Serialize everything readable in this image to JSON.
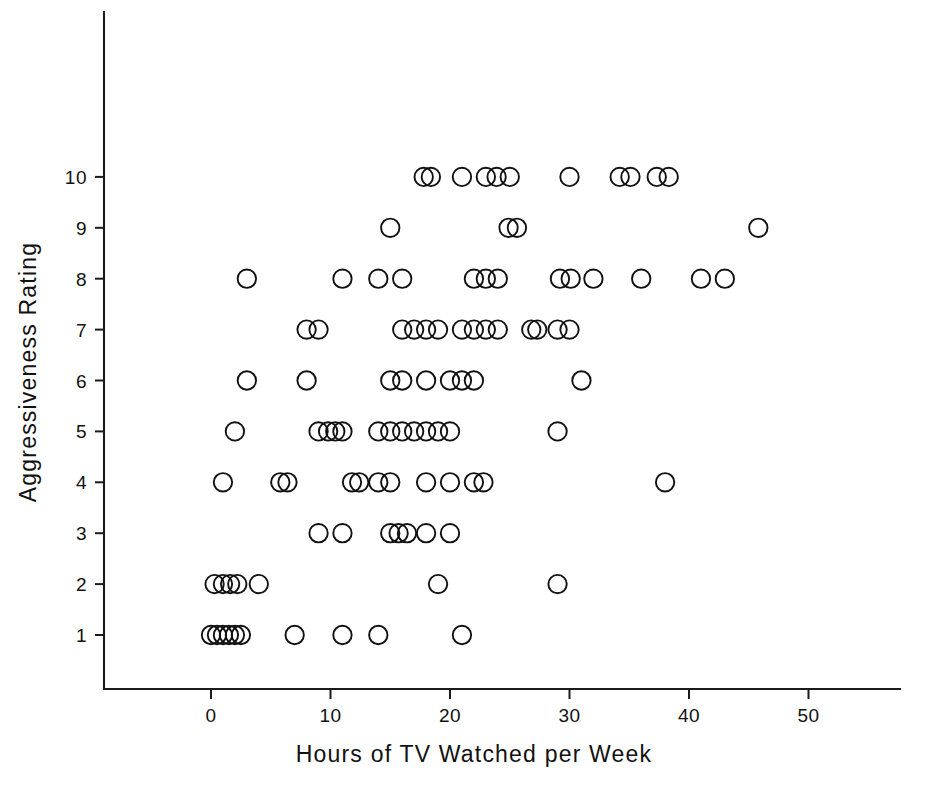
{
  "chart_data": {
    "type": "scatter",
    "title": "",
    "xlabel": "Hours of TV Watched per Week",
    "ylabel": "Aggressiveness Rating",
    "xlim": [
      -5,
      57
    ],
    "ylim": [
      0.3,
      11.4
    ],
    "xticks": [
      0,
      10,
      20,
      30,
      40,
      50
    ],
    "xticklabels": [
      "0",
      "10",
      "20",
      "30",
      "40",
      "50"
    ],
    "yticks": [
      1,
      2,
      3,
      4,
      5,
      6,
      7,
      8,
      9,
      10
    ],
    "yticklabels": [
      "1",
      "2",
      "3",
      "4",
      "5",
      "6",
      "7",
      "8",
      "9",
      "10"
    ],
    "grid": false,
    "legend": null,
    "marker": "open-circle",
    "marker_color": "#111111",
    "points": [
      {
        "x": 0,
        "y": 1
      },
      {
        "x": 0.5,
        "y": 1
      },
      {
        "x": 1,
        "y": 1
      },
      {
        "x": 1.5,
        "y": 1
      },
      {
        "x": 2,
        "y": 1
      },
      {
        "x": 2.5,
        "y": 1
      },
      {
        "x": 7,
        "y": 1
      },
      {
        "x": 11,
        "y": 1
      },
      {
        "x": 14,
        "y": 1
      },
      {
        "x": 21,
        "y": 1
      },
      {
        "x": 0.3,
        "y": 2
      },
      {
        "x": 1,
        "y": 2
      },
      {
        "x": 1.6,
        "y": 2
      },
      {
        "x": 2.2,
        "y": 2
      },
      {
        "x": 4,
        "y": 2
      },
      {
        "x": 19,
        "y": 2
      },
      {
        "x": 29,
        "y": 2
      },
      {
        "x": 9,
        "y": 3
      },
      {
        "x": 11,
        "y": 3
      },
      {
        "x": 15,
        "y": 3
      },
      {
        "x": 15.7,
        "y": 3
      },
      {
        "x": 16.4,
        "y": 3
      },
      {
        "x": 18,
        "y": 3
      },
      {
        "x": 20,
        "y": 3
      },
      {
        "x": 1,
        "y": 4
      },
      {
        "x": 5.8,
        "y": 4
      },
      {
        "x": 6.4,
        "y": 4
      },
      {
        "x": 11.8,
        "y": 4
      },
      {
        "x": 12.4,
        "y": 4
      },
      {
        "x": 14,
        "y": 4
      },
      {
        "x": 15,
        "y": 4
      },
      {
        "x": 18,
        "y": 4
      },
      {
        "x": 20,
        "y": 4
      },
      {
        "x": 22,
        "y": 4
      },
      {
        "x": 22.8,
        "y": 4
      },
      {
        "x": 38,
        "y": 4
      },
      {
        "x": 2,
        "y": 5
      },
      {
        "x": 9,
        "y": 5
      },
      {
        "x": 9.8,
        "y": 5
      },
      {
        "x": 10.4,
        "y": 5
      },
      {
        "x": 11,
        "y": 5
      },
      {
        "x": 14,
        "y": 5
      },
      {
        "x": 15,
        "y": 5
      },
      {
        "x": 16,
        "y": 5
      },
      {
        "x": 17,
        "y": 5
      },
      {
        "x": 18,
        "y": 5
      },
      {
        "x": 19,
        "y": 5
      },
      {
        "x": 20,
        "y": 5
      },
      {
        "x": 29,
        "y": 5
      },
      {
        "x": 3,
        "y": 6
      },
      {
        "x": 8,
        "y": 6
      },
      {
        "x": 15,
        "y": 6
      },
      {
        "x": 16,
        "y": 6
      },
      {
        "x": 18,
        "y": 6
      },
      {
        "x": 20,
        "y": 6
      },
      {
        "x": 21,
        "y": 6
      },
      {
        "x": 22,
        "y": 6
      },
      {
        "x": 31,
        "y": 6
      },
      {
        "x": 8,
        "y": 7
      },
      {
        "x": 9,
        "y": 7
      },
      {
        "x": 16,
        "y": 7
      },
      {
        "x": 17,
        "y": 7
      },
      {
        "x": 18,
        "y": 7
      },
      {
        "x": 19,
        "y": 7
      },
      {
        "x": 21,
        "y": 7
      },
      {
        "x": 22,
        "y": 7
      },
      {
        "x": 23,
        "y": 7
      },
      {
        "x": 24,
        "y": 7
      },
      {
        "x": 26.8,
        "y": 7
      },
      {
        "x": 27.3,
        "y": 7
      },
      {
        "x": 29,
        "y": 7
      },
      {
        "x": 30,
        "y": 7
      },
      {
        "x": 3,
        "y": 8
      },
      {
        "x": 11,
        "y": 8
      },
      {
        "x": 14,
        "y": 8
      },
      {
        "x": 16,
        "y": 8
      },
      {
        "x": 22,
        "y": 8
      },
      {
        "x": 23,
        "y": 8
      },
      {
        "x": 24,
        "y": 8
      },
      {
        "x": 29.2,
        "y": 8
      },
      {
        "x": 30.1,
        "y": 8
      },
      {
        "x": 32,
        "y": 8
      },
      {
        "x": 36,
        "y": 8
      },
      {
        "x": 41,
        "y": 8
      },
      {
        "x": 43,
        "y": 8
      },
      {
        "x": 15,
        "y": 9
      },
      {
        "x": 24.9,
        "y": 9
      },
      {
        "x": 25.6,
        "y": 9
      },
      {
        "x": 45.8,
        "y": 9
      },
      {
        "x": 17.8,
        "y": 10
      },
      {
        "x": 18.4,
        "y": 10
      },
      {
        "x": 21,
        "y": 10
      },
      {
        "x": 23,
        "y": 10
      },
      {
        "x": 23.9,
        "y": 10
      },
      {
        "x": 25,
        "y": 10
      },
      {
        "x": 30,
        "y": 10
      },
      {
        "x": 34.2,
        "y": 10
      },
      {
        "x": 35.1,
        "y": 10
      },
      {
        "x": 37.3,
        "y": 10
      },
      {
        "x": 38.3,
        "y": 10
      }
    ]
  }
}
